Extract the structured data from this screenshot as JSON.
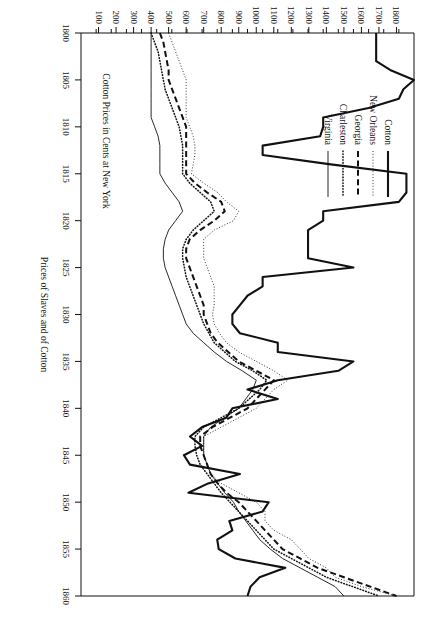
{
  "figure": {
    "title": "Prices of Slaves and of Cotton",
    "left_axis_title_line1": "Slave Prices in Dollars",
    "left_axis_title_line2": "(Prime Field Hands)",
    "inner_axis_title": "Cotton Prices in Cents at New York",
    "rotation_note": "chart printed rotated 90 degrees on the page"
  },
  "axes": {
    "x": {
      "label": "",
      "ticks": [
        "1800",
        "1805",
        "1810",
        "1815",
        "1820",
        "1825",
        "1830",
        "1835",
        "1840",
        "1845",
        "1850",
        "1855",
        "1860"
      ],
      "min": 1800,
      "max": 1860
    },
    "y_dollars": {
      "label": "Slave Prices in Dollars (Prime Field Hands)",
      "ticks": [
        "100",
        "200",
        "300",
        "400",
        "500",
        "600",
        "700",
        "800",
        "900",
        "1000",
        "1100",
        "1200",
        "1300",
        "1400",
        "1500",
        "1600",
        "1700",
        "1800"
      ],
      "min": 0,
      "max": 1900
    },
    "y_cents": {
      "label": "Cotton Prices in Cents at New York",
      "ticks": [
        "1",
        "2",
        "3",
        "4",
        "5",
        "6",
        "7",
        "8",
        "9",
        "10",
        "11",
        "12",
        "13",
        "14",
        "15",
        "16",
        "17",
        "18",
        "19",
        "20",
        "21"
      ],
      "min": 0,
      "max": 22
    }
  },
  "legend": {
    "position": "upper-left",
    "items": [
      {
        "label": "Cotton",
        "style": "thick-solid",
        "series_key": "cotton"
      },
      {
        "label": "New Orleans",
        "style": "fine-dotted",
        "series_key": "new_orleans"
      },
      {
        "label": "Georgia",
        "style": "dashed",
        "series_key": "georgia"
      },
      {
        "label": "Charleston",
        "style": "dotted",
        "series_key": "charleston"
      },
      {
        "label": "Virginia",
        "style": "thin-solid",
        "series_key": "virginia"
      }
    ]
  },
  "chart_data": {
    "type": "line",
    "title": "Prices of Slaves and of Cotton",
    "xlabel": "",
    "ylabel": "Slave Prices in Dollars (Prime Field Hands)",
    "ylabel_secondary": "Cotton Prices in Cents at New York",
    "xlim": [
      1800,
      1860
    ],
    "ylim_dollars": [
      0,
      1900
    ],
    "ylim_cents": [
      0,
      22
    ],
    "grid": false,
    "legend_position": "upper-left",
    "x": [
      1800,
      1801,
      1802,
      1803,
      1804,
      1805,
      1806,
      1807,
      1808,
      1809,
      1810,
      1811,
      1812,
      1813,
      1814,
      1815,
      1816,
      1817,
      1818,
      1819,
      1820,
      1821,
      1822,
      1823,
      1824,
      1825,
      1826,
      1827,
      1828,
      1829,
      1830,
      1831,
      1832,
      1833,
      1834,
      1835,
      1836,
      1837,
      1838,
      1839,
      1840,
      1841,
      1842,
      1843,
      1844,
      1845,
      1846,
      1847,
      1848,
      1849,
      1850,
      1851,
      1852,
      1853,
      1854,
      1855,
      1856,
      1857,
      1858,
      1859,
      1860
    ],
    "series": [
      {
        "name": "Cotton",
        "unit": "cents per pound at New York",
        "axis": "y_cents",
        "values": [
          19.5,
          19.5,
          19.5,
          19.5,
          20.5,
          22.0,
          21.3,
          21.0,
          19.0,
          16.0,
          16.0,
          15.8,
          12.0,
          12.0,
          16.5,
          21.5,
          21.5,
          21.5,
          21.0,
          16.0,
          16.0,
          15.0,
          15.0,
          15.0,
          15.0,
          18.0,
          12.0,
          12.0,
          11.0,
          10.5,
          10.0,
          10.0,
          10.5,
          13.0,
          13.0,
          18.0,
          17.0,
          13.0,
          11.0,
          13.0,
          10.0,
          9.6,
          8.0,
          7.2,
          8.0,
          6.8,
          7.2,
          10.5,
          8.4,
          7.1,
          12.4,
          12.0,
          9.8,
          10.0,
          9.0,
          9.1,
          10.2,
          13.5,
          11.8,
          11.2,
          11.0
        ]
      },
      {
        "name": "New Orleans",
        "unit": "dollars per prime field hand",
        "axis": "y_dollars",
        "values": [
          500,
          520,
          540,
          560,
          580,
          600,
          600,
          600,
          600,
          600,
          620,
          640,
          650,
          650,
          640,
          630,
          700,
          780,
          830,
          900,
          870,
          760,
          700,
          700,
          700,
          720,
          740,
          760,
          760,
          760,
          750,
          760,
          790,
          830,
          900,
          1000,
          1100,
          1180,
          1100,
          1050,
          1000,
          900,
          800,
          700,
          700,
          700,
          720,
          740,
          800,
          900,
          1000,
          1050,
          1050,
          1100,
          1200,
          1250,
          1300,
          1400,
          1450,
          1600,
          1800
        ]
      },
      {
        "name": "Georgia",
        "unit": "dollars per prime field hand",
        "axis": "y_dollars",
        "values": [
          450,
          470,
          480,
          490,
          500,
          500,
          520,
          540,
          560,
          580,
          600,
          600,
          600,
          600,
          600,
          600,
          650,
          720,
          800,
          820,
          760,
          680,
          620,
          600,
          600,
          620,
          640,
          660,
          680,
          700,
          700,
          720,
          740,
          780,
          840,
          900,
          1000,
          1100,
          1050,
          1000,
          950,
          850,
          750,
          680,
          680,
          700,
          720,
          740,
          780,
          830,
          900,
          950,
          1000,
          1050,
          1100,
          1150,
          1250,
          1350,
          1500,
          1650,
          1800
        ]
      },
      {
        "name": "Charleston",
        "unit": "dollars per prime field hand",
        "axis": "y_dollars",
        "values": [
          400,
          420,
          440,
          450,
          460,
          470,
          480,
          500,
          520,
          540,
          560,
          570,
          580,
          580,
          580,
          580,
          620,
          680,
          740,
          760,
          700,
          640,
          600,
          580,
          580,
          590,
          600,
          620,
          640,
          660,
          680,
          700,
          730,
          760,
          820,
          880,
          980,
          1060,
          1020,
          960,
          900,
          800,
          700,
          650,
          650,
          660,
          680,
          720,
          760,
          800,
          850,
          900,
          950,
          1000,
          1050,
          1100,
          1200,
          1300,
          1400,
          1550,
          1700
        ]
      },
      {
        "name": "Virginia",
        "unit": "dollars per prime field hand",
        "axis": "y_dollars",
        "values": [
          400,
          400,
          400,
          400,
          400,
          400,
          400,
          400,
          400,
          400,
          420,
          440,
          450,
          450,
          450,
          450,
          480,
          520,
          560,
          580,
          540,
          500,
          480,
          470,
          470,
          480,
          500,
          520,
          540,
          560,
          580,
          600,
          640,
          700,
          760,
          830,
          920,
          1000,
          980,
          940,
          900,
          820,
          740,
          700,
          700,
          700,
          720,
          740,
          780,
          820,
          870,
          900,
          940,
          980,
          1020,
          1080,
          1150,
          1250,
          1350,
          1450,
          1500
        ]
      }
    ]
  }
}
